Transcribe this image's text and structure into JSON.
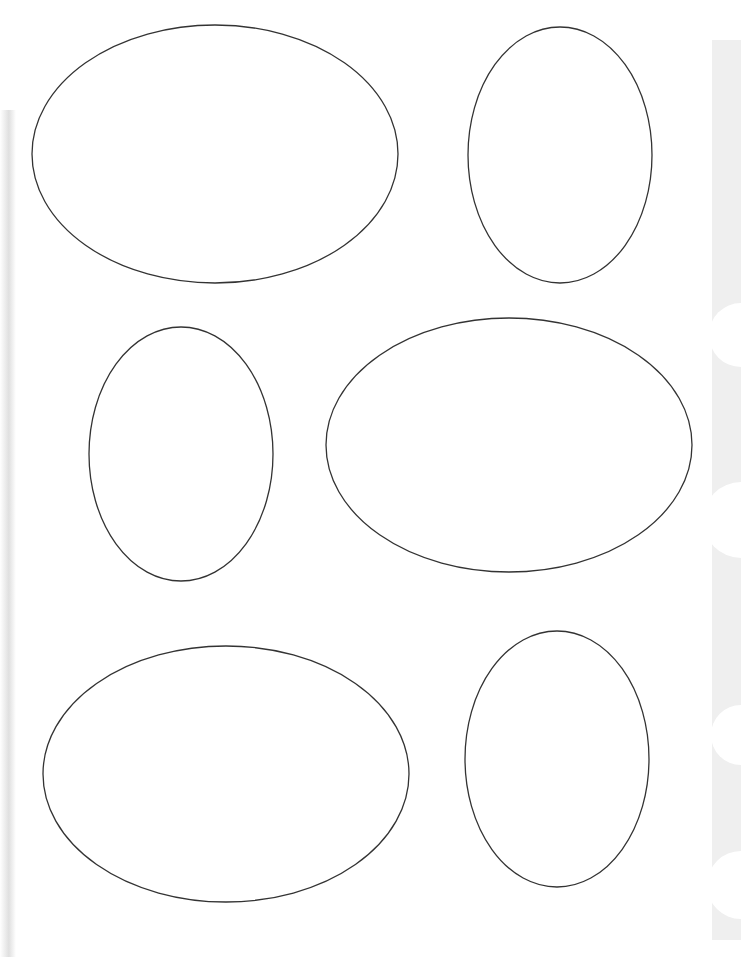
{
  "page": {
    "type": "oval-template-sheet",
    "background_color": "#ffffff",
    "stroke_color": "#333333",
    "edge_strip_color": "#efefef"
  },
  "ovals": [
    {
      "id": "oval-1",
      "orientation": "landscape",
      "cx": 215,
      "cy": 154,
      "rx": 183,
      "ry": 129
    },
    {
      "id": "oval-2",
      "orientation": "portrait",
      "cx": 560,
      "cy": 155,
      "rx": 92,
      "ry": 128
    },
    {
      "id": "oval-3",
      "orientation": "portrait",
      "cx": 181,
      "cy": 454,
      "rx": 92,
      "ry": 127
    },
    {
      "id": "oval-4",
      "orientation": "landscape",
      "cx": 509,
      "cy": 445,
      "rx": 183,
      "ry": 127
    },
    {
      "id": "oval-5",
      "orientation": "landscape",
      "cx": 226,
      "cy": 774,
      "rx": 183,
      "ry": 128
    },
    {
      "id": "oval-6",
      "orientation": "portrait",
      "cx": 557,
      "cy": 759,
      "rx": 92,
      "ry": 128
    }
  ],
  "edge_notches": [
    {
      "cy": 335,
      "r": 32
    },
    {
      "cy": 520,
      "r": 38
    },
    {
      "cy": 735,
      "r": 30
    },
    {
      "cy": 885,
      "r": 34
    }
  ]
}
